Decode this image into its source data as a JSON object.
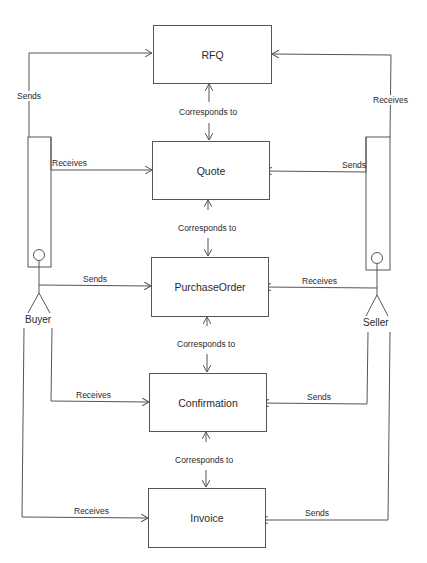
{
  "diagram": {
    "type": "use-case / message flow",
    "actors": [
      {
        "id": "buyer",
        "label": "Buyer"
      },
      {
        "id": "seller",
        "label": "Seller"
      }
    ],
    "documents": [
      {
        "id": "rfq",
        "label": "RFQ"
      },
      {
        "id": "quote",
        "label": "Quote"
      },
      {
        "id": "purchase_order",
        "label": "PurchaseOrder"
      },
      {
        "id": "confirmation",
        "label": "Confirmation"
      },
      {
        "id": "invoice",
        "label": "Invoice"
      }
    ],
    "correspondences": [
      {
        "from": "RFQ",
        "to": "Quote",
        "label": "Corresponds to"
      },
      {
        "from": "Quote",
        "to": "PurchaseOrder",
        "label": "Corresponds to"
      },
      {
        "from": "PurchaseOrder",
        "to": "Confirmation",
        "label": "Corresponds to"
      },
      {
        "from": "Confirmation",
        "to": "Invoice",
        "label": "Corresponds to"
      }
    ],
    "buyer_edges": [
      {
        "target": "RFQ",
        "label": "Sends"
      },
      {
        "target": "Quote",
        "label": "Receives"
      },
      {
        "target": "PurchaseOrder",
        "label": "Sends"
      },
      {
        "target": "Confirmation",
        "label": "Receives"
      },
      {
        "target": "Invoice",
        "label": "Receives"
      }
    ],
    "seller_edges": [
      {
        "target": "RFQ",
        "label": "Receives"
      },
      {
        "target": "Quote",
        "label": "Sends"
      },
      {
        "target": "PurchaseOrder",
        "label": "Receives"
      },
      {
        "target": "Confirmation",
        "label": "Sends"
      },
      {
        "target": "Invoice",
        "label": "Sends"
      }
    ]
  },
  "colors": {
    "line": "#555555",
    "text": "#2a2a2a",
    "background": "#ffffff"
  }
}
